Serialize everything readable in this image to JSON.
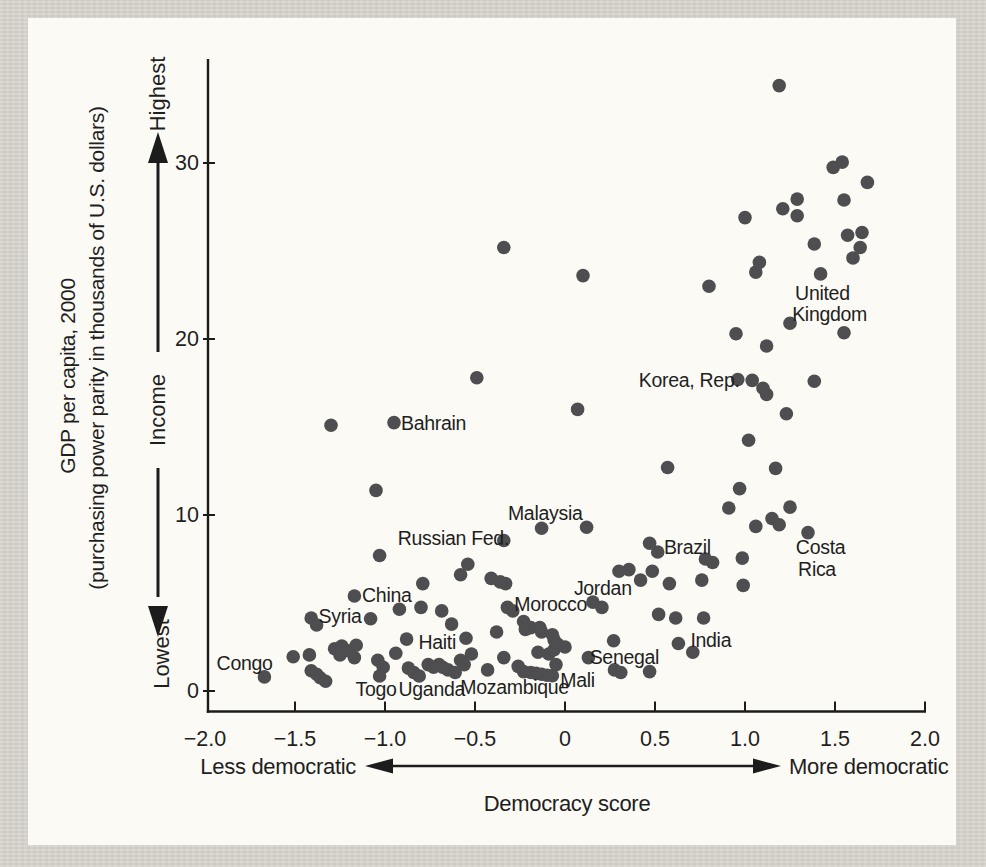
{
  "figure": {
    "background_color": "#d7d5cd",
    "panel_color": "#fbfaf5",
    "dot_color": "#4e4e50",
    "axis_color": "#1c1c1c",
    "text_color": "#1f1f1f"
  },
  "y_axis": {
    "title_line1": "GDP per capita, 2000",
    "title_line2": "(purchasing power parity in thousands of U.S. dollars)",
    "arrow_top_label": "Highest",
    "arrow_mid_label": "Income",
    "arrow_bottom_label": "Lowest",
    "ticks": [
      {
        "label": "0",
        "value": 0
      },
      {
        "label": "10",
        "value": 10
      },
      {
        "label": "20",
        "value": 20
      },
      {
        "label": "30",
        "value": 30
      }
    ]
  },
  "x_axis": {
    "title": "Democracy score",
    "left_label": "Less democratic",
    "right_label": "More democratic",
    "ticks": [
      {
        "label": "−2.0",
        "value": -2.0,
        "mark": false
      },
      {
        "label": "−1.5",
        "value": -1.5,
        "mark": true
      },
      {
        "label": "−1.0",
        "value": -1.0,
        "mark": true
      },
      {
        "label": "−0.5",
        "value": -0.5,
        "mark": true
      },
      {
        "label": "0",
        "value": 0,
        "mark": true
      },
      {
        "label": "0.5",
        "value": 0.5,
        "mark": true
      },
      {
        "label": "1.0",
        "value": 1.0,
        "mark": true
      },
      {
        "label": "1.5",
        "value": 1.5,
        "mark": true
      },
      {
        "label": "2.0",
        "value": 2.0,
        "mark": true
      }
    ]
  },
  "chart_data": {
    "type": "scatter",
    "title": "",
    "xlabel": "Democracy score",
    "ylabel": "GDP per capita, 2000 (purchasing power parity in thousands of U.S. dollars)",
    "xlim": [
      -2.0,
      2.0
    ],
    "ylim": [
      0,
      35
    ],
    "grid": false,
    "legend": null,
    "points": [
      [
        -1.67,
        0.8
      ],
      [
        -1.51,
        1.95
      ],
      [
        -1.42,
        2.05
      ],
      [
        -1.41,
        1.15
      ],
      [
        -1.38,
        0.95
      ],
      [
        -1.36,
        0.75
      ],
      [
        -1.33,
        0.55
      ],
      [
        -1.41,
        4.15
      ],
      [
        -1.38,
        3.75
      ],
      [
        -1.3,
        15.1
      ],
      [
        -1.28,
        2.4
      ],
      [
        -1.25,
        2.05
      ],
      [
        -1.24,
        2.55
      ],
      [
        -1.21,
        2.3
      ],
      [
        -1.17,
        1.9
      ],
      [
        -1.16,
        2.6
      ],
      [
        -1.17,
        5.4
      ],
      [
        -1.08,
        4.1
      ],
      [
        -1.05,
        11.4
      ],
      [
        -1.04,
        1.75
      ],
      [
        -1.03,
        7.7
      ],
      [
        -1.03,
        0.85
      ],
      [
        -1.01,
        1.35
      ],
      [
        -0.95,
        15.25
      ],
      [
        -0.94,
        2.15
      ],
      [
        -0.92,
        4.65
      ],
      [
        -0.88,
        2.95
      ],
      [
        -0.87,
        1.3
      ],
      [
        -0.84,
        1.05
      ],
      [
        -0.81,
        0.85
      ],
      [
        -0.8,
        4.75
      ],
      [
        -0.79,
        6.1
      ],
      [
        -0.76,
        1.5
      ],
      [
        -0.73,
        1.35
      ],
      [
        -0.7,
        1.5
      ],
      [
        -0.685,
        4.55
      ],
      [
        -0.68,
        1.35
      ],
      [
        -0.65,
        1.2
      ],
      [
        -0.63,
        3.8
      ],
      [
        -0.61,
        1.05
      ],
      [
        -0.58,
        6.6
      ],
      [
        -0.58,
        1.75
      ],
      [
        -0.56,
        1.5
      ],
      [
        -0.55,
        3.0
      ],
      [
        -0.54,
        7.2
      ],
      [
        -0.52,
        2.1
      ],
      [
        -0.49,
        17.8
      ],
      [
        -0.43,
        1.2
      ],
      [
        -0.41,
        6.4
      ],
      [
        -0.38,
        3.35
      ],
      [
        -0.36,
        6.2
      ],
      [
        -0.34,
        25.2
      ],
      [
        -0.34,
        8.55
      ],
      [
        -0.34,
        1.9
      ],
      [
        -0.33,
        6.1
      ],
      [
        -0.32,
        4.75
      ],
      [
        -0.29,
        4.55
      ],
      [
        -0.26,
        1.4
      ],
      [
        -0.23,
        3.95
      ],
      [
        -0.23,
        1.1
      ],
      [
        -0.22,
        3.5
      ],
      [
        -0.19,
        3.6
      ],
      [
        -0.19,
        1.05
      ],
      [
        -0.16,
        1.0
      ],
      [
        -0.15,
        2.2
      ],
      [
        -0.14,
        3.6
      ],
      [
        -0.13,
        3.35
      ],
      [
        -0.13,
        9.25
      ],
      [
        -0.13,
        0.95
      ],
      [
        -0.1,
        0.9
      ],
      [
        -0.09,
        2.1
      ],
      [
        -0.07,
        3.2
      ],
      [
        -0.07,
        0.87
      ],
      [
        -0.06,
        2.9
      ],
      [
        -0.06,
        2.35
      ],
      [
        -0.05,
        1.5
      ],
      [
        -0.04,
        2.65
      ],
      [
        0.0,
        2.5
      ],
      [
        0.07,
        16.0
      ],
      [
        0.1,
        23.6
      ],
      [
        0.12,
        9.3
      ],
      [
        0.13,
        1.9
      ],
      [
        0.155,
        5.05
      ],
      [
        0.205,
        4.75
      ],
      [
        0.27,
        2.85
      ],
      [
        0.275,
        1.2
      ],
      [
        0.31,
        1.05
      ],
      [
        0.3,
        6.8
      ],
      [
        0.355,
        6.9
      ],
      [
        0.42,
        6.3
      ],
      [
        0.47,
        8.4
      ],
      [
        0.47,
        1.1
      ],
      [
        0.485,
        6.8
      ],
      [
        0.515,
        7.9
      ],
      [
        0.52,
        4.35
      ],
      [
        0.57,
        12.7
      ],
      [
        0.58,
        6.1
      ],
      [
        0.615,
        4.15
      ],
      [
        0.63,
        2.7
      ],
      [
        0.71,
        2.2
      ],
      [
        0.76,
        6.3
      ],
      [
        0.77,
        4.15
      ],
      [
        0.78,
        7.5
      ],
      [
        0.82,
        7.3
      ],
      [
        0.8,
        23.0
      ],
      [
        0.91,
        10.4
      ],
      [
        0.95,
        20.3
      ],
      [
        0.96,
        17.7
      ],
      [
        0.97,
        11.5
      ],
      [
        0.985,
        7.55
      ],
      [
        0.99,
        6.0
      ],
      [
        1.0,
        26.9
      ],
      [
        1.02,
        14.25
      ],
      [
        1.04,
        17.65
      ],
      [
        1.06,
        9.35
      ],
      [
        1.06,
        23.8
      ],
      [
        1.08,
        24.35
      ],
      [
        1.1,
        17.2
      ],
      [
        1.12,
        16.85
      ],
      [
        1.12,
        19.6
      ],
      [
        1.15,
        9.8
      ],
      [
        1.17,
        12.65
      ],
      [
        1.19,
        9.45
      ],
      [
        1.19,
        34.4
      ],
      [
        1.21,
        27.4
      ],
      [
        1.23,
        15.75
      ],
      [
        1.25,
        20.9
      ],
      [
        1.25,
        10.45
      ],
      [
        1.29,
        27.95
      ],
      [
        1.29,
        27.0
      ],
      [
        1.35,
        9.0
      ],
      [
        1.385,
        17.6
      ],
      [
        1.385,
        25.4
      ],
      [
        1.42,
        23.7
      ],
      [
        1.49,
        29.75
      ],
      [
        1.54,
        30.05
      ],
      [
        1.55,
        27.9
      ],
      [
        1.55,
        20.35
      ],
      [
        1.57,
        25.9
      ],
      [
        1.6,
        24.6
      ],
      [
        1.64,
        25.2
      ],
      [
        1.65,
        26.05
      ],
      [
        1.68,
        28.9
      ]
    ],
    "annotations": [
      {
        "text": "Congo",
        "x": -1.78,
        "y": 1.55
      },
      {
        "text": "Syria",
        "x": -1.25,
        "y": 4.26
      },
      {
        "text": "China",
        "x": -0.99,
        "y": 5.45
      },
      {
        "text": "Haiti",
        "x": -0.71,
        "y": 2.78
      },
      {
        "text": "Togo",
        "x": -1.05,
        "y": 0.11
      },
      {
        "text": "Uganda",
        "x": -0.74,
        "y": 0.11
      },
      {
        "text": "Mozambique",
        "x": -0.28,
        "y": 0.23
      },
      {
        "text": "Mali",
        "x": 0.07,
        "y": 0.62
      },
      {
        "text": "Russian Fed.",
        "x": -0.62,
        "y": 8.64
      },
      {
        "text": "Malaysia",
        "x": -0.11,
        "y": 10.1
      },
      {
        "text": "Morocco",
        "x": -0.08,
        "y": 4.89
      },
      {
        "text": "Jordan",
        "x": 0.21,
        "y": 5.85
      },
      {
        "text": "Senegal",
        "x": 0.33,
        "y": 1.93
      },
      {
        "text": "India",
        "x": 0.81,
        "y": 2.9
      },
      {
        "text": "Brazil",
        "x": 0.68,
        "y": 8.18
      },
      {
        "text": "Bahrain",
        "x": -0.73,
        "y": 15.2
      },
      {
        "text": "Korea, Rep.",
        "x": 0.69,
        "y": 17.67
      },
      {
        "text": "United",
        "x": 1.43,
        "y": 22.6
      },
      {
        "text": "Kingdom",
        "x": 1.47,
        "y": 21.42
      },
      {
        "text": "Costa",
        "x": 1.42,
        "y": 8.13
      },
      {
        "text": "Rica",
        "x": 1.4,
        "y": 6.93
      }
    ]
  }
}
